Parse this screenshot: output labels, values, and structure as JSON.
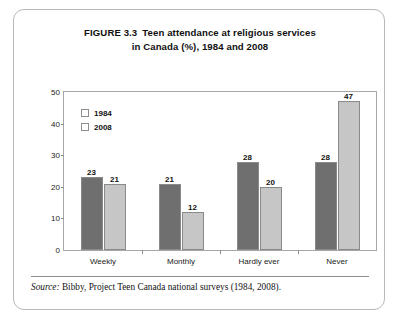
{
  "figure": {
    "title_line1_number": "FIGURE 3.3",
    "title_line1_text": "Teen attendance at religious services",
    "title_line2": "in Canada (%), 1984 and 2008",
    "source_label": "Source:",
    "source_text": "Bibby, Project Teen Canada national surveys (1984, 2008)."
  },
  "colors": {
    "series_1984": "#6f6f6f",
    "series_2008": "#c6c6c6",
    "frame": "#a7a7a7",
    "box_border": "#b9b9b9"
  },
  "chart_data": {
    "type": "bar",
    "xlabel": "",
    "ylabel": "",
    "ylim": [
      0,
      50
    ],
    "yticks": [
      "0",
      "10",
      "20",
      "30",
      "40",
      "50"
    ],
    "grid": false,
    "legend_position": "top-left inside plot",
    "categories": [
      "Weekly",
      "Monthly",
      "Hardly ever",
      "Never"
    ],
    "series": [
      {
        "name": "1984",
        "values": [
          23,
          21,
          28,
          28
        ]
      },
      {
        "name": "2008",
        "values": [
          21,
          12,
          20,
          47
        ]
      }
    ],
    "data_labels": {
      "Weekly": {
        "1984": "23",
        "2008": "21"
      },
      "Monthly": {
        "1984": "21",
        "2008": "12"
      },
      "Hardly ever": {
        "1984": "28",
        "2008": "20"
      },
      "Never": {
        "1984": "28",
        "2008": "47"
      }
    }
  }
}
